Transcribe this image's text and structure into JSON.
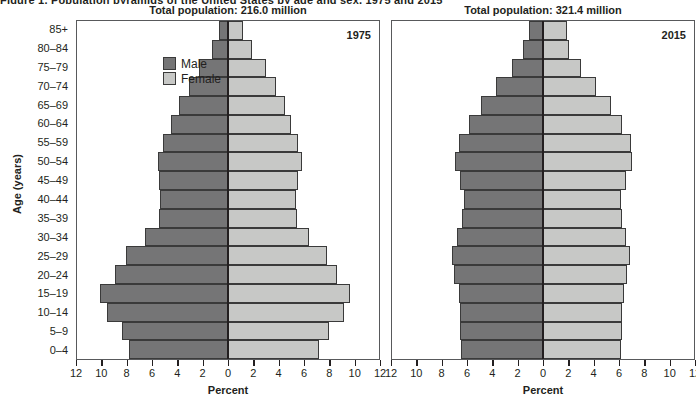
{
  "caption_clipped": "Figure 1.  Population pyramids of the United States by age and sex, 1975 and 2015",
  "axes": {
    "y_title": "Age (years)",
    "x_title": "Percent",
    "x_ticks": [
      12,
      10,
      8,
      6,
      4,
      2,
      0,
      2,
      4,
      6,
      8,
      10,
      12
    ],
    "x_max": 12,
    "age_groups_top_down": [
      "85+",
      "80–84",
      "75–79",
      "70–74",
      "65–69",
      "60–64",
      "55–59",
      "50–54",
      "45–49",
      "40–44",
      "35–39",
      "30–34",
      "25–29",
      "20–24",
      "15–19",
      "10–14",
      "5–9",
      "0–4"
    ]
  },
  "legend": {
    "items": [
      {
        "label": "Male",
        "color": "#757576"
      },
      {
        "label": "Female",
        "color": "#c7c8c6"
      }
    ]
  },
  "colors": {
    "male": "#757576",
    "female": "#c7c8c6",
    "bar_outline": "#3a3a3a",
    "panel_border": "#58595b",
    "text": "#231f20"
  },
  "chart_data": [
    {
      "type": "bar",
      "subtype": "population-pyramid",
      "title": "Total population: 216.0 million",
      "year_label": "1975",
      "total_population": "216.0 million",
      "xlabel": "Percent",
      "ylabel": "Age (years)",
      "xlim": [
        -12,
        12
      ],
      "grid": false,
      "legend_position": "top-left-inside",
      "categories": [
        "0–4",
        "5–9",
        "10–14",
        "15–19",
        "20–24",
        "25–29",
        "30–34",
        "35–39",
        "40–44",
        "45–49",
        "50–54",
        "55–59",
        "60–64",
        "65–69",
        "70–74",
        "75–79",
        "80–84",
        "85+"
      ],
      "series": [
        {
          "name": "Male",
          "values": [
            7.9,
            8.4,
            9.6,
            10.2,
            9.0,
            8.1,
            6.6,
            5.5,
            5.4,
            5.5,
            5.6,
            5.2,
            4.5,
            3.9,
            3.1,
            2.3,
            1.3,
            0.7
          ]
        },
        {
          "name": "Female",
          "values": [
            7.2,
            8.0,
            9.2,
            9.7,
            8.7,
            7.9,
            6.4,
            5.5,
            5.4,
            5.6,
            5.9,
            5.6,
            5.0,
            4.5,
            3.8,
            3.0,
            1.9,
            1.2
          ]
        }
      ]
    },
    {
      "type": "bar",
      "subtype": "population-pyramid",
      "title": "Total population: 321.4 million",
      "year_label": "2015",
      "total_population": "321.4 million",
      "xlabel": "Percent",
      "ylabel": "Age (years)",
      "xlim": [
        -12,
        12
      ],
      "grid": false,
      "legend_position": "none",
      "categories": [
        "0–4",
        "5–9",
        "10–14",
        "15–19",
        "20–24",
        "25–29",
        "30–34",
        "35–39",
        "40–44",
        "45–49",
        "50–54",
        "55–59",
        "60–64",
        "65–69",
        "70–74",
        "75–79",
        "80–84",
        "85+"
      ],
      "series": [
        {
          "name": "Male",
          "values": [
            6.5,
            6.6,
            6.6,
            6.7,
            7.1,
            7.2,
            6.8,
            6.4,
            6.3,
            6.6,
            7.0,
            6.7,
            5.9,
            4.9,
            3.7,
            2.5,
            1.6,
            1.1
          ]
        },
        {
          "name": "Female",
          "values": [
            6.2,
            6.3,
            6.3,
            6.4,
            6.7,
            6.9,
            6.6,
            6.3,
            6.2,
            6.6,
            7.1,
            7.0,
            6.3,
            5.4,
            4.2,
            3.0,
            2.1,
            1.9
          ]
        }
      ]
    }
  ]
}
